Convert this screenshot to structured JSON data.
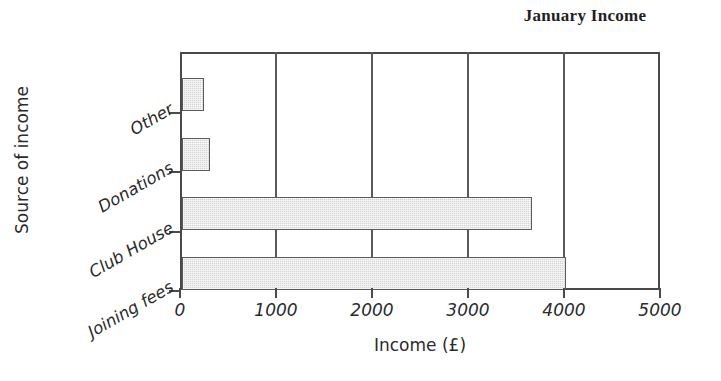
{
  "chart_data": {
    "type": "bar",
    "orientation": "horizontal",
    "title": "January Income",
    "xlabel": "Income (£)",
    "ylabel": "Source of income",
    "categories": [
      "Other",
      "Donations",
      "Club House",
      "Joining fees"
    ],
    "values": [
      230,
      290,
      3650,
      4000
    ],
    "xticks": [
      "0",
      "1000",
      "2000",
      "3000",
      "4000",
      "5000"
    ],
    "xtick_values": [
      0,
      1000,
      2000,
      3000,
      4000,
      5000
    ],
    "xlim": [
      0,
      5000
    ],
    "grid": "vertical",
    "legend": "none",
    "bar_fill_color": "#d4d4d4",
    "bar_edge_color": "#5b5b5b",
    "axis_color": "#4a4a4a",
    "background_color": "#ffffff"
  }
}
